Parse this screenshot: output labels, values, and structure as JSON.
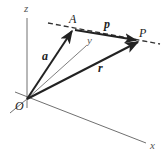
{
  "diagram": {
    "type": "3d-vector-line",
    "axes": {
      "x_label": "x",
      "y_label": "y",
      "z_label": "z",
      "origin_label": "O"
    },
    "points": {
      "A": "A",
      "P": "P"
    },
    "vectors": {
      "a": "a",
      "p": "p",
      "r": "r"
    },
    "colors": {
      "axis": "#707070",
      "vector": "#222222",
      "dashed_line": "#333333",
      "background": "#ffffff"
    }
  }
}
